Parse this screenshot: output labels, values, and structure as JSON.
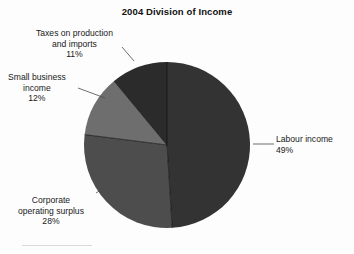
{
  "chart_data": {
    "type": "pie",
    "title": "2004 Division of Income",
    "xlabel": "",
    "ylabel": "",
    "legend_position": "callout-labels",
    "grid": false,
    "categories": [
      "Labour income",
      "Corporate operating surplus",
      "Small business income",
      "Taxes on production and imports"
    ],
    "values": [
      49,
      28,
      12,
      11
    ],
    "unit": "%",
    "start_angle_deg": 0,
    "direction": "clockwise",
    "slices": [
      {
        "label": "Labour income",
        "value": 49,
        "value_text": "49%",
        "color": "#333333"
      },
      {
        "label": "Corporate operating surplus",
        "value": 28,
        "value_text": "28%",
        "color": "#4d4d4d"
      },
      {
        "label": "Small business income",
        "value": 12,
        "value_text": "12%",
        "color": "#6e6e6e"
      },
      {
        "label": "Taxes on production and imports",
        "value": 11,
        "value_text": "11%",
        "color": "#2b2b2b"
      }
    ]
  },
  "title": "2004 Division of Income",
  "labels": {
    "taxes": {
      "line1": "Taxes on production",
      "line2": "and imports",
      "pct": "11%"
    },
    "small_business": {
      "line1": "Small business",
      "line2": "income",
      "pct": "12%"
    },
    "corporate": {
      "line1": "Corporate",
      "line2": "operating surplus",
      "pct": "28%"
    },
    "labour": {
      "line1": "Labour income",
      "pct": "49%"
    }
  },
  "colors": {
    "labour": "#333333",
    "corporate": "#4d4d4d",
    "small_business": "#6e6e6e",
    "taxes": "#2b2b2b",
    "background": "#fdfdfd",
    "text": "#1a1a1a",
    "leader_line": "#4a4a4a"
  }
}
